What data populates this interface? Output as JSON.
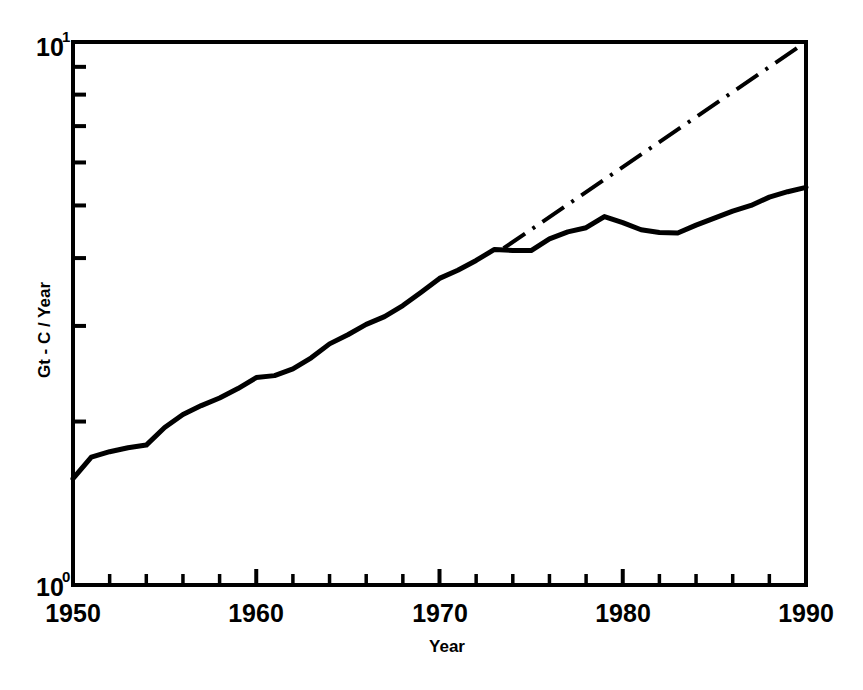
{
  "chart_data": {
    "type": "line",
    "title": "",
    "subtitle": "",
    "xlabel": "Year",
    "ylabel": "Gt - C / Year",
    "xlim": [
      1950,
      1990
    ],
    "ylim": [
      1,
      10
    ],
    "yscale": "log",
    "xscale": "linear",
    "grid": false,
    "legend": "none",
    "frame": "box",
    "x_major_ticks": [
      1950,
      1960,
      1970,
      1980,
      1990
    ],
    "x_major_tick_labels": [
      "1950",
      "1960",
      "1970",
      "1980",
      "1990"
    ],
    "x_minor_tick_interval": 2,
    "y_major_ticks": [
      1,
      10
    ],
    "y_major_tick_labels": [
      "10⁰",
      "10¹"
    ],
    "y_minor_ticks": [
      2,
      3,
      4,
      5,
      6,
      7,
      8,
      9
    ],
    "series": [
      {
        "name": "Actual emissions",
        "style": "solid",
        "color": "#000000",
        "x": [
          1950,
          1951,
          1952,
          1953,
          1954,
          1955,
          1956,
          1957,
          1958,
          1959,
          1960,
          1961,
          1962,
          1963,
          1964,
          1965,
          1966,
          1967,
          1968,
          1969,
          1970,
          1971,
          1972,
          1973,
          1974,
          1975,
          1976,
          1977,
          1978,
          1979,
          1980,
          1981,
          1982,
          1983,
          1984,
          1985,
          1986,
          1987,
          1988,
          1989,
          1990
        ],
        "values": [
          1.57,
          1.72,
          1.76,
          1.79,
          1.81,
          1.95,
          2.06,
          2.14,
          2.21,
          2.3,
          2.41,
          2.43,
          2.5,
          2.62,
          2.78,
          2.89,
          3.02,
          3.12,
          3.27,
          3.46,
          3.67,
          3.8,
          3.96,
          4.15,
          4.13,
          4.13,
          4.34,
          4.47,
          4.55,
          4.77,
          4.65,
          4.51,
          4.46,
          4.45,
          4.6,
          4.74,
          4.88,
          5.0,
          5.18,
          5.3,
          5.4
        ]
      },
      {
        "name": "Pre-1973 exponential trend",
        "style": "dash-dot",
        "color": "#000000",
        "x": [
          1973.5,
          1990
        ],
        "values": [
          4.17,
          10.0
        ]
      }
    ],
    "annotations": []
  },
  "axes": {
    "y_top_label_base": "10",
    "y_top_label_exp": "1",
    "y_bottom_label_base": "10",
    "y_bottom_label_exp": "0",
    "x_labels": [
      "1950",
      "1960",
      "1970",
      "1980",
      "1990"
    ],
    "y_axis_title": "Gt - C / Year",
    "x_axis_title": "Year"
  },
  "colors": {
    "background": "#ffffff",
    "ink": "#000000",
    "curve": "#000000",
    "trend": "#000000"
  }
}
